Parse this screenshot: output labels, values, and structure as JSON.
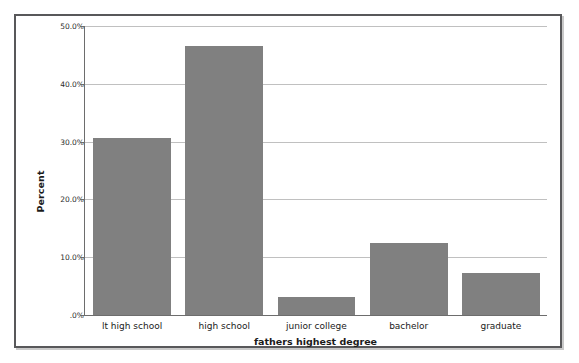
{
  "chart_data": {
    "type": "bar",
    "title": "",
    "xlabel": "fathers highest degree",
    "ylabel": "Percent",
    "categories": [
      "lt high school",
      "high school",
      "junior college",
      "bachelor",
      "graduate"
    ],
    "values": [
      30.6,
      46.6,
      3.1,
      12.5,
      7.2
    ],
    "ylim": [
      0,
      50
    ],
    "ytick_values": [
      0,
      10,
      20,
      30,
      40,
      50
    ],
    "ytick_labels": [
      ".0%",
      "10.0%",
      "20.0%",
      "30.0%",
      "40.0%",
      "50.0%"
    ],
    "grid": true,
    "legend": "none",
    "bar_color": "#808080",
    "gridline_color": "#c0c0c0",
    "axis_color": "#6d6d6d",
    "frame_color": "#58585a",
    "background_color": "#ffffff"
  }
}
